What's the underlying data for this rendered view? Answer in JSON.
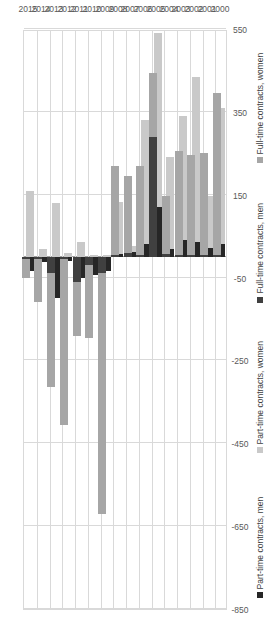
{
  "chart_data": {
    "type": "bar",
    "orientation": "horizontal-rotated",
    "stacked": true,
    "title": "",
    "subtitle": "",
    "xlabel": "",
    "ylabel": "",
    "categories": [
      "2000",
      "2001",
      "2002",
      "2003",
      "2004",
      "2005",
      "2006",
      "2007",
      "2008",
      "2009",
      "2010",
      "2011",
      "2012",
      "2013",
      "2014",
      "2015"
    ],
    "value_axis": {
      "ticks": [
        550,
        350,
        150,
        -50,
        -250,
        -450,
        -650,
        -850
      ],
      "tick_labels": [
        "550",
        "350",
        "150",
        "-50",
        "-250",
        "-450",
        "-650",
        "-850"
      ],
      "min": -850,
      "max": 550,
      "grid": true,
      "zero_line": true
    },
    "legend": {
      "position": "bottom",
      "entries": [
        {
          "label": "Part-time contracts, men",
          "color": "#262626",
          "key": "pt_men"
        },
        {
          "label": "Part-time contracts, women",
          "color": "#c9c9c9",
          "key": "pt_women"
        },
        {
          "label": "Full-time contracts, men",
          "color": "#404040",
          "key": "ft_men"
        },
        {
          "label": "Full-time contracts, women",
          "color": "#a6a6a6",
          "key": "ft_women"
        }
      ]
    },
    "series": [
      {
        "name": "Part-time contracts, men",
        "key": "pt_men",
        "color": "#262626",
        "values": [
          30,
          22,
          35,
          40,
          20,
          120,
          30,
          12,
          8,
          -35,
          -45,
          -50,
          -10,
          -100,
          -12,
          -35
        ]
      },
      {
        "name": "Part-time contracts, women",
        "key": "pt_women",
        "color": "#c9c9c9",
        "values": [
          330,
          125,
          400,
          300,
          220,
          420,
          300,
          15,
          125,
          5,
          5,
          35,
          10,
          130,
          20,
          160
        ]
      },
      {
        "name": "Full-time contracts, men",
        "key": "ft_men",
        "color": "#404040",
        "values": [
          5,
          5,
          5,
          5,
          8,
          290,
          5,
          10,
          5,
          -40,
          -20,
          -60,
          -5,
          -40,
          -5,
          -5
        ]
      },
      {
        "name": "Full-time contracts, women",
        "key": "ft_women",
        "color": "#a6a6a6",
        "values": [
          390,
          245,
          240,
          250,
          140,
          155,
          215,
          185,
          215,
          -580,
          -175,
          -130,
          -400,
          -275,
          -105,
          -45
        ]
      }
    ],
    "bar_groups": [
      {
        "year": "2000",
        "part_time": {
          "men": 30,
          "women": 330
        },
        "full_time": {
          "men": 5,
          "women": 390
        }
      },
      {
        "year": "2001",
        "part_time": {
          "men": 22,
          "women": 125
        },
        "full_time": {
          "men": 5,
          "women": 245
        }
      },
      {
        "year": "2002",
        "part_time": {
          "men": 35,
          "women": 400
        },
        "full_time": {
          "men": 5,
          "women": 240
        }
      },
      {
        "year": "2003",
        "part_time": {
          "men": 40,
          "women": 300
        },
        "full_time": {
          "men": 5,
          "women": 250
        }
      },
      {
        "year": "2004",
        "part_time": {
          "men": 20,
          "women": 220
        },
        "full_time": {
          "men": 8,
          "women": 140
        }
      },
      {
        "year": "2005",
        "part_time": {
          "men": 120,
          "women": 420
        },
        "full_time": {
          "men": 290,
          "women": 155
        }
      },
      {
        "year": "2006",
        "part_time": {
          "men": 30,
          "women": 300
        },
        "full_time": {
          "men": 5,
          "women": 215
        }
      },
      {
        "year": "2007",
        "part_time": {
          "men": 12,
          "women": 15
        },
        "full_time": {
          "men": 10,
          "women": 185
        }
      },
      {
        "year": "2008",
        "part_time": {
          "men": 8,
          "women": 125
        },
        "full_time": {
          "men": 5,
          "women": 215
        }
      },
      {
        "year": "2009",
        "part_time": {
          "men": -35,
          "women": 5
        },
        "full_time": {
          "men": -40,
          "women": -580
        }
      },
      {
        "year": "2010",
        "part_time": {
          "men": -45,
          "women": 5
        },
        "full_time": {
          "men": -20,
          "women": -175
        }
      },
      {
        "year": "2011",
        "part_time": {
          "men": -50,
          "women": 35
        },
        "full_time": {
          "men": -60,
          "women": -130
        }
      },
      {
        "year": "2012",
        "part_time": {
          "men": -10,
          "women": 10
        },
        "full_time": {
          "men": -5,
          "women": -400
        }
      },
      {
        "year": "2013",
        "part_time": {
          "men": -100,
          "women": 130
        },
        "full_time": {
          "men": -40,
          "women": -275
        }
      },
      {
        "year": "2014",
        "part_time": {
          "men": -12,
          "women": 20
        },
        "full_time": {
          "men": -5,
          "women": -105
        }
      },
      {
        "year": "2015",
        "part_time": {
          "men": -35,
          "women": 160
        },
        "full_time": {
          "men": -5,
          "women": -45
        }
      }
    ]
  }
}
